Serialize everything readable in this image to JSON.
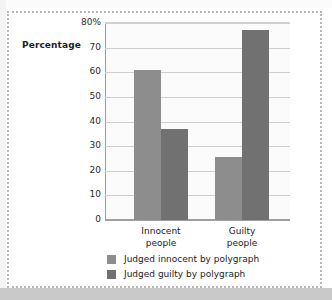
{
  "chart_data": {
    "type": "bar",
    "title": "",
    "subtitle": "",
    "xlabel": "",
    "ylabel": "Percentage",
    "ylim": [
      0,
      80
    ],
    "grid": true,
    "legend_position": "bottom",
    "categories": [
      "Innocent people",
      "Guilty people"
    ],
    "category_lines": [
      [
        "Innocent",
        "people"
      ],
      [
        "Guilty",
        "people"
      ]
    ],
    "ytick_labels": [
      "80%",
      "70",
      "60",
      "50",
      "40",
      "30",
      "20",
      "10",
      "0"
    ],
    "ytick_values": [
      80,
      70,
      60,
      50,
      40,
      30,
      20,
      10,
      0
    ],
    "series": [
      {
        "name": "Judged innocent by polygraph",
        "color": "#8d8d8d",
        "values": [
          61,
          25.5
        ]
      },
      {
        "name": "Judged guilty by polygraph",
        "color": "#717171",
        "values": [
          37,
          77
        ]
      }
    ]
  },
  "axis": {
    "y_title": "Percentage"
  },
  "legend": {
    "items": [
      {
        "label": "Judged innocent by polygraph",
        "color": "#8d8d8d"
      },
      {
        "label": "Judged guilty by polygraph",
        "color": "#717171"
      }
    ]
  },
  "colors": {
    "series_light": "#8d8d8d",
    "series_dark": "#717171",
    "plot_background": "#fbfbfb",
    "gridline": "#cfcfcf",
    "axis_line": "#9a9a9a",
    "frame_dotted": "#b9b9b9",
    "page_background": "#ffffff",
    "footer_band": "#c9c9c9"
  }
}
